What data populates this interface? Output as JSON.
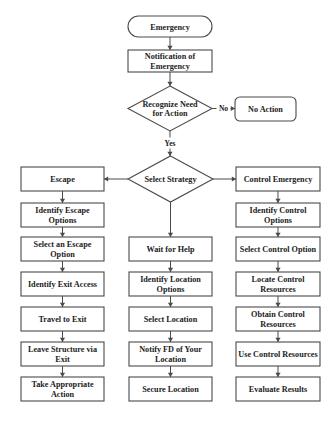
{
  "diagram": {
    "type": "flowchart",
    "nodes": [
      {
        "id": "emergency",
        "shape": "terminator",
        "lines": [
          "Emergency"
        ]
      },
      {
        "id": "notification",
        "shape": "process",
        "lines": [
          "Notification of",
          "Emergency"
        ]
      },
      {
        "id": "recognize",
        "shape": "decision",
        "lines": [
          "Recognize Need",
          "for Action"
        ]
      },
      {
        "id": "no-action",
        "shape": "rounded",
        "lines": [
          "No Action"
        ]
      },
      {
        "id": "select-strategy",
        "shape": "decision",
        "lines": [
          "Select Strategy"
        ]
      },
      {
        "id": "escape",
        "shape": "process",
        "lines": [
          "Escape"
        ]
      },
      {
        "id": "identify-escape",
        "shape": "process",
        "lines": [
          "Identify Escape",
          "Options"
        ]
      },
      {
        "id": "select-escape",
        "shape": "process",
        "lines": [
          "Select an Escape",
          "Option"
        ]
      },
      {
        "id": "identify-exit",
        "shape": "process",
        "lines": [
          "Identify Exit Access"
        ]
      },
      {
        "id": "travel-exit",
        "shape": "process",
        "lines": [
          "Travel to Exit"
        ]
      },
      {
        "id": "leave-structure",
        "shape": "process",
        "lines": [
          "Leave Structure via",
          "Exit"
        ]
      },
      {
        "id": "take-action",
        "shape": "process",
        "lines": [
          "Take Appropriate",
          "Action"
        ]
      },
      {
        "id": "wait-help",
        "shape": "process",
        "lines": [
          "Wait for Help"
        ]
      },
      {
        "id": "identify-location",
        "shape": "process",
        "lines": [
          "Identify Location",
          "Options"
        ]
      },
      {
        "id": "select-location",
        "shape": "process",
        "lines": [
          "Select Location"
        ]
      },
      {
        "id": "notify-fd",
        "shape": "process",
        "lines": [
          "Notify FD of Your",
          "Location"
        ]
      },
      {
        "id": "secure-location",
        "shape": "process",
        "lines": [
          "Secure Location"
        ]
      },
      {
        "id": "control-emergency",
        "shape": "process",
        "lines": [
          "Control Emergency"
        ]
      },
      {
        "id": "identify-control",
        "shape": "process",
        "lines": [
          "Identify Control",
          "Options"
        ]
      },
      {
        "id": "select-control",
        "shape": "process",
        "lines": [
          "Select Control Option"
        ]
      },
      {
        "id": "locate-control",
        "shape": "process",
        "lines": [
          "Locate Control",
          "Resources"
        ]
      },
      {
        "id": "obtain-control",
        "shape": "process",
        "lines": [
          "Obtain Control",
          "Resources"
        ]
      },
      {
        "id": "use-control",
        "shape": "process",
        "lines": [
          "Use Control Resources"
        ]
      },
      {
        "id": "evaluate",
        "shape": "process",
        "lines": [
          "Evaluate Results"
        ]
      }
    ],
    "edges": [
      {
        "from": "emergency",
        "to": "notification",
        "label": ""
      },
      {
        "from": "notification",
        "to": "recognize",
        "label": ""
      },
      {
        "from": "recognize",
        "to": "no-action",
        "label": "No"
      },
      {
        "from": "recognize",
        "to": "select-strategy",
        "label": "Yes"
      },
      {
        "from": "select-strategy",
        "to": "escape",
        "label": ""
      },
      {
        "from": "select-strategy",
        "to": "wait-help",
        "label": ""
      },
      {
        "from": "select-strategy",
        "to": "control-emergency",
        "label": ""
      },
      {
        "from": "escape",
        "to": "identify-escape",
        "label": ""
      },
      {
        "from": "identify-escape",
        "to": "select-escape",
        "label": ""
      },
      {
        "from": "select-escape",
        "to": "identify-exit",
        "label": ""
      },
      {
        "from": "identify-exit",
        "to": "travel-exit",
        "label": ""
      },
      {
        "from": "travel-exit",
        "to": "leave-structure",
        "label": ""
      },
      {
        "from": "leave-structure",
        "to": "take-action",
        "label": ""
      },
      {
        "from": "wait-help",
        "to": "identify-location",
        "label": ""
      },
      {
        "from": "identify-location",
        "to": "select-location",
        "label": ""
      },
      {
        "from": "select-location",
        "to": "notify-fd",
        "label": ""
      },
      {
        "from": "notify-fd",
        "to": "secure-location",
        "label": ""
      },
      {
        "from": "control-emergency",
        "to": "identify-control",
        "label": ""
      },
      {
        "from": "identify-control",
        "to": "select-control",
        "label": ""
      },
      {
        "from": "select-control",
        "to": "locate-control",
        "label": ""
      },
      {
        "from": "locate-control",
        "to": "obtain-control",
        "label": ""
      },
      {
        "from": "obtain-control",
        "to": "use-control",
        "label": ""
      },
      {
        "from": "use-control",
        "to": "evaluate",
        "label": ""
      }
    ]
  }
}
